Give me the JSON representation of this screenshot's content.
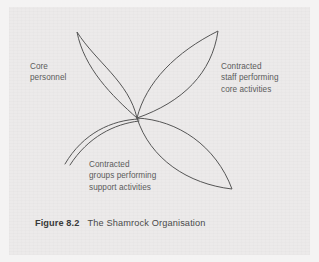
{
  "figure": {
    "caption_number": "Figure 8.2",
    "caption_title": "The Shamrock Organisation",
    "stroke_color": "#555555",
    "background_color": "#eceaea",
    "page_margin_color": "#f4f3f3",
    "text_color": "#5b5b5b"
  },
  "diagram": {
    "type": "shamrock-organisation",
    "center": {
      "x": 137,
      "y": 118
    },
    "petals": [
      {
        "name": "upper-left-petal",
        "label_key": "core",
        "tip": {
          "x": 77,
          "y": 32
        }
      },
      {
        "name": "upper-right-petal",
        "label_key": "contracted_staff",
        "tip": {
          "x": 218,
          "y": 31
        }
      },
      {
        "name": "lower-right-petal",
        "label_key": "contracted_groups",
        "tip": {
          "x": 232,
          "y": 189
        }
      }
    ],
    "stem": {
      "name": "open-stem-tail",
      "end": {
        "x": 65,
        "y": 164
      },
      "lines": 2
    }
  },
  "labels": {
    "core": {
      "line1": "Core",
      "line2": "personnel"
    },
    "contracted_staff": {
      "line1": "Contracted",
      "line2": "staff performing",
      "line3": "core activities"
    },
    "contracted_groups": {
      "line1": "Contracted",
      "line2": "groups performing",
      "line3": "support activities"
    }
  }
}
